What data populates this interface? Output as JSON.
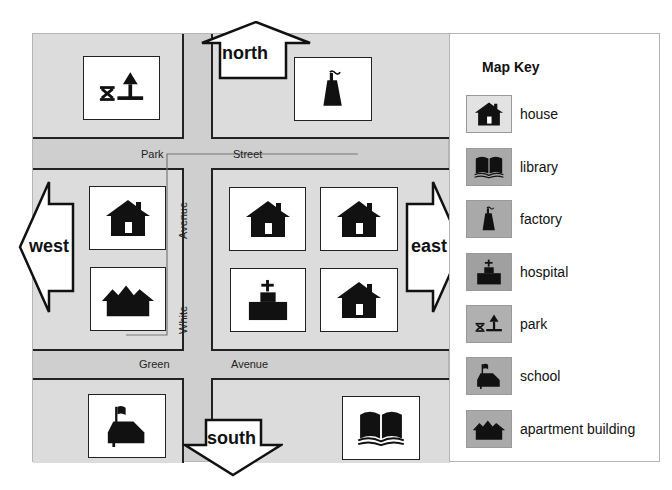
{
  "map": {
    "background_color": "#cfcfcf",
    "block_color": "#dcdcdc",
    "streets": [
      {
        "name": "Park Street",
        "words": [
          "Park",
          "Street"
        ]
      },
      {
        "name": "Green Avenue",
        "words": [
          "Green",
          "Avenue"
        ]
      },
      {
        "name": "White Avenue",
        "words": [
          "White",
          "Avenue"
        ]
      }
    ],
    "directions": {
      "north": "north",
      "south": "south",
      "east": "east",
      "west": "west"
    },
    "tiles": [
      {
        "block": "top-left",
        "type": "park"
      },
      {
        "block": "top-right",
        "type": "factory"
      },
      {
        "block": "middle-left",
        "type": "house"
      },
      {
        "block": "middle-left",
        "type": "apartment building"
      },
      {
        "block": "middle-right",
        "type": "house"
      },
      {
        "block": "middle-right",
        "type": "house"
      },
      {
        "block": "middle-right",
        "type": "hospital"
      },
      {
        "block": "middle-right",
        "type": "house"
      },
      {
        "block": "bottom-left",
        "type": "school"
      },
      {
        "block": "bottom-right",
        "type": "library"
      }
    ]
  },
  "key": {
    "title": "Map Key",
    "items": [
      {
        "label": "house",
        "icon": "house-icon",
        "swatch_color": "#e2e2e2"
      },
      {
        "label": "library",
        "icon": "book-icon",
        "swatch_color": "#a9a9a9"
      },
      {
        "label": "factory",
        "icon": "factory-icon",
        "swatch_color": "#a9a9a9"
      },
      {
        "label": "hospital",
        "icon": "hospital-icon",
        "swatch_color": "#a0a0a0"
      },
      {
        "label": "park",
        "icon": "park-icon",
        "swatch_color": "#b0b0b0"
      },
      {
        "label": "school",
        "icon": "school-icon",
        "swatch_color": "#a9a9a9"
      },
      {
        "label": "apartment building",
        "icon": "apartment-icon",
        "swatch_color": "#a9a9a9"
      }
    ]
  }
}
